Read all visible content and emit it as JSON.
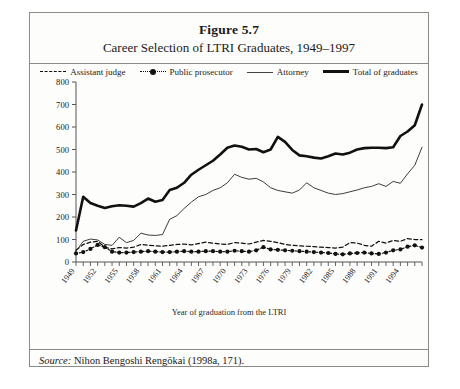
{
  "figure": {
    "number": "Figure 5.7",
    "caption": "Career Selection of LTRI Graduates, 1949–1997",
    "source_label": "Source:",
    "source_text": " Nihon Bengoshi Rengōkai (1998a, 171)."
  },
  "chart_data": {
    "type": "line",
    "title": "Career Selection of LTRI Graduates, 1949–1997",
    "xlabel": "Year of graduation from the LTRI",
    "ylabel": "",
    "ylim": [
      0,
      800
    ],
    "ytick_step": 100,
    "yticks": [
      0,
      100,
      200,
      300,
      400,
      500,
      600,
      700,
      800
    ],
    "xlim": [
      1949,
      1997
    ],
    "xtick_labels": [
      "1949",
      "1952",
      "1955",
      "1958",
      "1961",
      "1964",
      "1967",
      "1970",
      "1973",
      "1976",
      "1979",
      "1982",
      "1985",
      "1988",
      "1991",
      "1994"
    ],
    "xtick_label_step": 3,
    "xtick_minor_every_year": true,
    "grid": false,
    "legend_position": "top-center",
    "x": [
      1949,
      1950,
      1951,
      1952,
      1953,
      1954,
      1955,
      1956,
      1957,
      1958,
      1959,
      1960,
      1961,
      1962,
      1963,
      1964,
      1965,
      1966,
      1967,
      1968,
      1969,
      1970,
      1971,
      1972,
      1973,
      1974,
      1975,
      1976,
      1977,
      1978,
      1979,
      1980,
      1981,
      1982,
      1983,
      1984,
      1985,
      1986,
      1987,
      1988,
      1989,
      1990,
      1991,
      1992,
      1993,
      1994,
      1995,
      1996,
      1997
    ],
    "series": [
      {
        "name": "Assistant judge",
        "style": "dashed",
        "values": [
          52,
          78,
          88,
          92,
          66,
          58,
          64,
          62,
          66,
          78,
          74,
          72,
          70,
          74,
          78,
          80,
          76,
          82,
          88,
          84,
          80,
          78,
          86,
          84,
          80,
          88,
          96,
          92,
          86,
          78,
          74,
          72,
          70,
          68,
          66,
          64,
          62,
          66,
          86,
          84,
          74,
          70,
          92,
          84,
          96,
          92,
          104,
          100,
          100
        ]
      },
      {
        "name": "Public prosecutor",
        "style": "dotted-marker",
        "values": [
          38,
          44,
          58,
          76,
          66,
          46,
          42,
          42,
          44,
          46,
          48,
          46,
          44,
          44,
          46,
          48,
          46,
          46,
          48,
          48,
          46,
          46,
          50,
          48,
          46,
          52,
          66,
          56,
          54,
          52,
          50,
          48,
          46,
          44,
          42,
          40,
          36,
          34,
          38,
          40,
          42,
          38,
          36,
          42,
          52,
          56,
          68,
          74,
          64
        ]
      },
      {
        "name": "Attorney",
        "style": "thin",
        "values": [
          48,
          92,
          102,
          98,
          78,
          74,
          110,
          86,
          96,
          128,
          120,
          118,
          122,
          190,
          206,
          238,
          266,
          290,
          300,
          318,
          330,
          352,
          390,
          376,
          368,
          372,
          356,
          330,
          318,
          312,
          306,
          320,
          352,
          330,
          318,
          306,
          300,
          304,
          312,
          320,
          330,
          336,
          348,
          336,
          358,
          350,
          392,
          430,
          510
        ]
      },
      {
        "name": "Total of graduates",
        "style": "thick",
        "values": [
          140,
          290,
          262,
          250,
          240,
          248,
          252,
          250,
          246,
          262,
          282,
          268,
          276,
          320,
          330,
          352,
          388,
          410,
          430,
          450,
          478,
          508,
          518,
          512,
          500,
          502,
          488,
          500,
          556,
          534,
          498,
          474,
          470,
          464,
          460,
          470,
          482,
          478,
          486,
          500,
          506,
          508,
          508,
          506,
          510,
          560,
          580,
          608,
          700
        ]
      }
    ]
  },
  "legend": {
    "items": [
      {
        "label": "Assistant judge",
        "swatch": "dashed-line-swatch"
      },
      {
        "label": "Public prosecutor",
        "swatch": "dotted-marker-line-swatch"
      },
      {
        "label": "Attorney",
        "swatch": "thin-line-swatch"
      },
      {
        "label": "Total of graduates",
        "swatch": "thick-line-swatch"
      }
    ]
  },
  "colors": {
    "ink": "#111111",
    "frame": "#8a8a86",
    "axis": "#555555",
    "page": "#ffffff"
  }
}
